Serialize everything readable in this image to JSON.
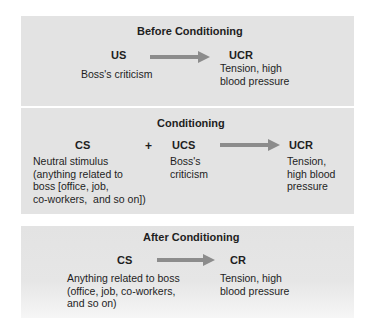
{
  "colors": {
    "panel_bg": "#e3e3e3",
    "arrow": "#8c8c8c",
    "text": "#1e1e1e"
  },
  "panels": [
    {
      "title": "Before Conditioning",
      "stimulus": {
        "term": "US",
        "description": "Boss's criticism"
      },
      "response": {
        "term": "UCR",
        "description": "Tension, high\nblood pressure"
      }
    },
    {
      "title": "Conditioning",
      "stimulus": {
        "term": "CS",
        "description": "Neutral stimulus\n(anything related to\nboss [office, job,\nco-workers,  and so on])"
      },
      "operator": "+",
      "stimulus2": {
        "term": "UCS",
        "description": "Boss's\ncriticism"
      },
      "response": {
        "term": "UCR",
        "description": "Tension,\nhigh blood\npressure"
      }
    },
    {
      "title": "After Conditioning",
      "stimulus": {
        "term": "CS",
        "description": "Anything related to boss\n(office, job, co-workers,\nand so on)"
      },
      "response": {
        "term": "CR",
        "description": "Tension, high\nblood pressure"
      }
    }
  ]
}
